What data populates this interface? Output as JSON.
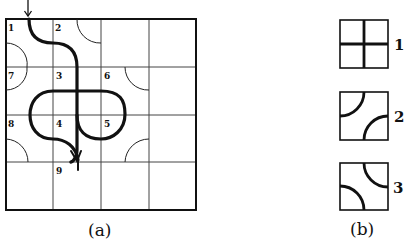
{
  "figure_a": {
    "label": "(a)",
    "grid": {
      "rows": 4,
      "cols": 4
    },
    "cell_numbers": [
      {
        "n": "1",
        "row": 0,
        "col": 0
      },
      {
        "n": "2",
        "row": 0,
        "col": 1
      },
      {
        "n": "7",
        "row": 1,
        "col": 0
      },
      {
        "n": "3",
        "row": 1,
        "col": 1
      },
      {
        "n": "6",
        "row": 1,
        "col": 2
      },
      {
        "n": "8",
        "row": 2,
        "col": 0
      },
      {
        "n": "4",
        "row": 2,
        "col": 1
      },
      {
        "n": "5",
        "row": 2,
        "col": 2
      },
      {
        "n": "9",
        "row": 3,
        "col": 1
      }
    ],
    "entry_arrow": "arrow-down"
  },
  "figure_b": {
    "label": "(b)",
    "tiles": [
      {
        "label": "1",
        "type": "cross"
      },
      {
        "label": "2",
        "type": "arcs-top-left-bottom-right"
      },
      {
        "label": "3",
        "type": "arcs-top-right-bottom-left"
      }
    ]
  },
  "colors": {
    "ink": "#111111",
    "background": "#ffffff",
    "grid": "#333333"
  }
}
